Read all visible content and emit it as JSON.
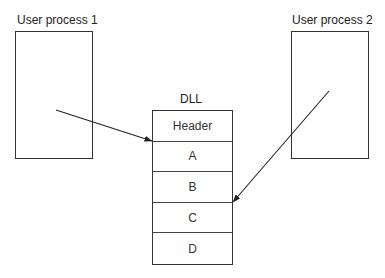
{
  "diagram": {
    "processes": [
      {
        "label": "User process 1"
      },
      {
        "label": "User process 2"
      }
    ],
    "dll": {
      "title": "DLL",
      "cells": [
        "Header",
        "A",
        "B",
        "C",
        "D"
      ]
    },
    "arrows": [
      {
        "from": "User process 1",
        "to": "DLL A"
      },
      {
        "from": "User process 2",
        "to": "DLL C"
      }
    ]
  }
}
